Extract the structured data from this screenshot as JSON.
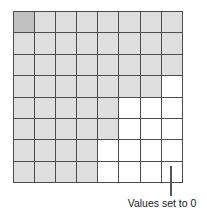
{
  "figure": {
    "name": "grid-diagram",
    "annotation": {
      "text": "Values set to 0",
      "leader_line": "vertical-leader-line"
    },
    "colors": {
      "shaded": "#dedede",
      "shaded_dark": "#c0c0c0",
      "empty": "#ffffff",
      "grid_line": "#4d4d4d",
      "leader_line": "#545454",
      "text": "#1a1a1a"
    }
  },
  "chart_data": {
    "type": "heatmap",
    "title": "",
    "subtitle": "",
    "xlabel": "",
    "ylabel": "",
    "rows": 8,
    "cols": 8,
    "grid": true,
    "legend": "none",
    "annotations": [
      {
        "text": "Values set to 0",
        "points_to": "row 8, column 8",
        "position": "below-right"
      }
    ],
    "value_labels": {
      "2": "origin-cell",
      "1": "shaded",
      "0": "values set to 0"
    },
    "values": [
      [
        2,
        1,
        1,
        1,
        1,
        1,
        1,
        1
      ],
      [
        1,
        1,
        1,
        1,
        1,
        1,
        1,
        1
      ],
      [
        1,
        1,
        1,
        1,
        1,
        1,
        1,
        1
      ],
      [
        1,
        1,
        1,
        1,
        1,
        1,
        1,
        0
      ],
      [
        1,
        1,
        1,
        1,
        1,
        0,
        0,
        0
      ],
      [
        1,
        1,
        1,
        1,
        1,
        0,
        0,
        0
      ],
      [
        1,
        1,
        1,
        1,
        0,
        0,
        0,
        0
      ],
      [
        1,
        1,
        1,
        1,
        0,
        0,
        0,
        0
      ]
    ]
  }
}
